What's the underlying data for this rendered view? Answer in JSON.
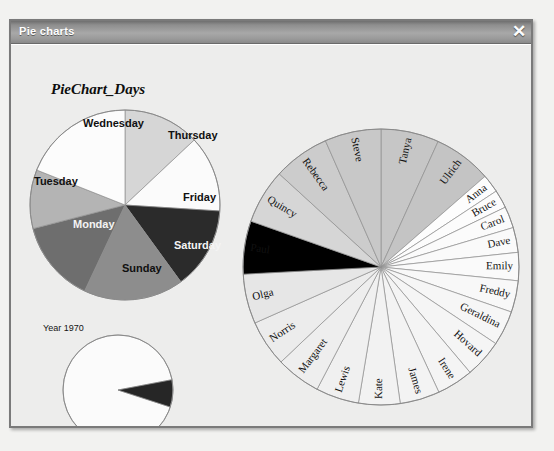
{
  "window": {
    "title": "Pie charts",
    "close_icon": "close-icon",
    "close_glyph": "✕"
  },
  "colors": {
    "titlebar_dark": "#6f6f6f",
    "titlebar_light": "#a8a8a8",
    "client_bg": "#ededec",
    "outline": "#6f6f6f"
  },
  "chart_data": [
    {
      "id": "piechart-days",
      "type": "pie",
      "title": "PieChart_Days",
      "labels": [
        "Thursday",
        "Friday",
        "Saturday",
        "Sunday",
        "Monday",
        "Tuesday",
        "Wednesday"
      ],
      "values": [
        13,
        13,
        14,
        17,
        14,
        10,
        19
      ],
      "slice_colors": [
        "#d6d6d6",
        "#fbfbfb",
        "#2b2b2b",
        "#8d8d8d",
        "#6e6e6e",
        "#b4b4b4",
        "#fcfcfc"
      ],
      "label_colors": [
        "dark",
        "dark",
        "light",
        "dark",
        "light",
        "dark",
        "dark"
      ],
      "start_angle": 0,
      "legend": "none",
      "grid": false
    },
    {
      "id": "piechart-years",
      "type": "pie",
      "title": "",
      "labels": [
        "Year 1970",
        "Year 1920"
      ],
      "values": [
        92,
        8
      ],
      "slice_colors": [
        "#fbfbfb",
        "#262626"
      ],
      "start_angle": 108,
      "legend": "none",
      "grid": false
    },
    {
      "id": "piechart-names",
      "type": "pie",
      "title": "",
      "labels": [
        "Tanya",
        "Ulrich",
        "Anna",
        "Bruce",
        "Carol",
        "Dave",
        "Emily",
        "Freddy",
        "Geraldina",
        "Hovard",
        "Irene",
        "James",
        "Kate",
        "Lewis",
        "Margaret",
        "Norris",
        "Olga",
        "Paul",
        "Quincy",
        "Rebecca",
        "Steve"
      ],
      "values": [
        7.0,
        7.0,
        2.2,
        2.2,
        2.6,
        3.0,
        3.4,
        3.8,
        4.2,
        4.6,
        4.4,
        4.8,
        5.0,
        5.2,
        5.4,
        5.6,
        6.0,
        6.4,
        6.6,
        6.8,
        6.8
      ],
      "slice_colors": [
        "#c6c6c6",
        "#c4c4c4",
        "#fdfdfd",
        "#fcfcfc",
        "#fbfbfb",
        "#fafafa",
        "#fafafa",
        "#f8f8f8",
        "#f6f6f6",
        "#f5f5f5",
        "#f4f4f4",
        "#f3f3f3",
        "#f2f2f2",
        "#f0f0f0",
        "#eeeeee",
        "#ececec",
        "#e6e6e6",
        "#dededea",
        "#d6d6d6",
        "#cccccc",
        "#c8c8c8"
      ],
      "start_angle": 0,
      "legend": "none",
      "grid": false
    }
  ],
  "days_labels": [
    {
      "text": "Wednesday",
      "x": 72,
      "y": 72,
      "tone": "dark"
    },
    {
      "text": "Thursday",
      "x": 157,
      "y": 84,
      "tone": "dark"
    },
    {
      "text": "Tuesday",
      "x": 23,
      "y": 130,
      "tone": "dark"
    },
    {
      "text": "Friday",
      "x": 172,
      "y": 146,
      "tone": "dark"
    },
    {
      "text": "Monday",
      "x": 62,
      "y": 173,
      "tone": "light"
    },
    {
      "text": "Saturday",
      "x": 163,
      "y": 194,
      "tone": "light"
    },
    {
      "text": "Sunday",
      "x": 111,
      "y": 217,
      "tone": "dark"
    }
  ],
  "years_labels": [
    {
      "text": "Year 1970",
      "x": 32,
      "y": 278,
      "tone": "dark"
    },
    {
      "text": "Year 1920",
      "x": 157,
      "y": 385,
      "tone": "dark"
    }
  ]
}
